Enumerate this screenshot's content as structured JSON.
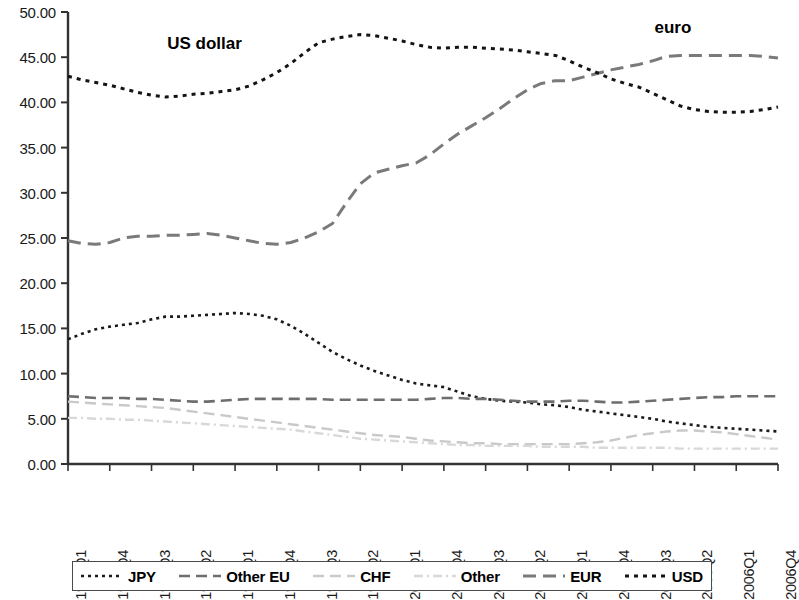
{
  "chart_data": {
    "type": "line",
    "title": "",
    "xlabel": "",
    "ylabel": "",
    "ylim": [
      0,
      50
    ],
    "ytick_step": 5,
    "grid": false,
    "legend_position": "bottom",
    "y_ticks": [
      "0.00",
      "5.00",
      "10.00",
      "15.00",
      "20.00",
      "25.00",
      "30.00",
      "35.00",
      "40.00",
      "45.00",
      "50.00"
    ],
    "x": [
      "1994Q1",
      "1994Q2",
      "1994Q3",
      "1994Q4",
      "1995Q1",
      "1995Q2",
      "1995Q3",
      "1995Q4",
      "1996Q1",
      "1996Q2",
      "1996Q3",
      "1996Q4",
      "1997Q1",
      "1997Q2",
      "1997Q3",
      "1997Q4",
      "1998Q1",
      "1998Q2",
      "1998Q3",
      "1998Q4",
      "1999Q1",
      "1999Q2",
      "1999Q3",
      "1999Q4",
      "2000Q1",
      "2000Q2",
      "2000Q3",
      "2000Q4",
      "2001Q1",
      "2001Q2",
      "2001Q3",
      "2001Q4",
      "2002Q1",
      "2002Q2",
      "2002Q3",
      "2002Q4",
      "2003Q1",
      "2003Q2",
      "2003Q3",
      "2003Q4",
      "2004Q1",
      "2004Q2",
      "2004Q3",
      "2004Q4",
      "2005Q1",
      "2005Q2",
      "2005Q3",
      "2005Q4",
      "2006Q1",
      "2006Q2",
      "2006Q3",
      "2006Q4"
    ],
    "x_tick_labels": [
      "1994Q1",
      "1994Q4",
      "1995Q3",
      "1996Q2",
      "1997Q1",
      "1997Q4",
      "1998Q3",
      "1999Q2",
      "2000Q1",
      "2000Q4",
      "2001Q3",
      "2002Q2",
      "2003Q1",
      "2003Q4",
      "2004Q3",
      "2005Q2",
      "2006Q1",
      "2006Q4"
    ],
    "x_tick_indices": [
      0,
      3,
      6,
      9,
      12,
      15,
      18,
      21,
      24,
      27,
      30,
      33,
      36,
      39,
      42,
      45,
      48,
      51
    ],
    "series": [
      {
        "name": "JPY",
        "color": "#1a1a1a",
        "dash": "3,4",
        "width": 2.6,
        "values": [
          13.8,
          14.4,
          14.9,
          15.2,
          15.4,
          15.6,
          16.0,
          16.3,
          16.3,
          16.4,
          16.5,
          16.6,
          16.7,
          16.6,
          16.4,
          16.0,
          15.3,
          14.4,
          13.4,
          12.4,
          11.6,
          10.9,
          10.3,
          9.8,
          9.3,
          8.9,
          8.7,
          8.5,
          8.0,
          7.5,
          7.2,
          7.0,
          6.9,
          6.8,
          6.6,
          6.5,
          6.3,
          6.0,
          5.8,
          5.6,
          5.4,
          5.2,
          5.0,
          4.7,
          4.5,
          4.3,
          4.1,
          4.0,
          3.9,
          3.8,
          3.7,
          3.6
        ]
      },
      {
        "name": "Other EU",
        "color": "#6e6e6e",
        "dash": "11,6",
        "width": 2.6,
        "values": [
          7.5,
          7.4,
          7.3,
          7.3,
          7.3,
          7.2,
          7.2,
          7.1,
          7.0,
          6.9,
          6.9,
          7.0,
          7.1,
          7.2,
          7.2,
          7.2,
          7.2,
          7.2,
          7.2,
          7.1,
          7.1,
          7.1,
          7.1,
          7.1,
          7.1,
          7.1,
          7.2,
          7.3,
          7.3,
          7.2,
          7.2,
          7.1,
          7.0,
          6.9,
          6.9,
          6.9,
          7.0,
          7.0,
          6.9,
          6.8,
          6.8,
          6.9,
          7.0,
          7.1,
          7.2,
          7.3,
          7.4,
          7.4,
          7.5,
          7.5,
          7.5,
          7.5
        ]
      },
      {
        "name": "CHF",
        "color": "#c9c9c9",
        "dash": "11,6",
        "width": 2.4,
        "values": [
          6.9,
          6.8,
          6.7,
          6.6,
          6.5,
          6.4,
          6.3,
          6.2,
          6.0,
          5.8,
          5.6,
          5.4,
          5.2,
          5.0,
          4.8,
          4.6,
          4.4,
          4.2,
          4.0,
          3.8,
          3.6,
          3.4,
          3.2,
          3.1,
          3.0,
          2.8,
          2.6,
          2.5,
          2.4,
          2.3,
          2.3,
          2.2,
          2.2,
          2.2,
          2.2,
          2.2,
          2.2,
          2.3,
          2.4,
          2.6,
          2.9,
          3.2,
          3.4,
          3.6,
          3.7,
          3.7,
          3.6,
          3.5,
          3.3,
          3.1,
          2.9,
          2.7
        ]
      },
      {
        "name": "Other",
        "color": "#d8d8d8",
        "dash": "9,4,2,4",
        "width": 2.4,
        "values": [
          5.1,
          5.1,
          5.0,
          5.0,
          4.9,
          4.9,
          4.8,
          4.7,
          4.6,
          4.5,
          4.4,
          4.3,
          4.2,
          4.1,
          4.0,
          3.9,
          3.8,
          3.6,
          3.4,
          3.2,
          3.0,
          2.8,
          2.7,
          2.6,
          2.5,
          2.4,
          2.3,
          2.2,
          2.1,
          2.1,
          2.0,
          2.0,
          2.0,
          2.0,
          1.9,
          1.9,
          1.9,
          1.9,
          1.8,
          1.8,
          1.8,
          1.8,
          1.8,
          1.8,
          1.7,
          1.7,
          1.7,
          1.7,
          1.7,
          1.7,
          1.7,
          1.7
        ]
      },
      {
        "name": "EUR",
        "color": "#7a7a7a",
        "dash": "13,7",
        "width": 3.0,
        "values": [
          24.7,
          24.4,
          24.3,
          24.5,
          25.0,
          25.2,
          25.2,
          25.3,
          25.3,
          25.4,
          25.5,
          25.3,
          25.0,
          24.7,
          24.4,
          24.3,
          24.5,
          25.0,
          25.7,
          26.6,
          28.9,
          31.0,
          32.2,
          32.6,
          33.0,
          33.3,
          34.2,
          35.4,
          36.5,
          37.4,
          38.3,
          39.3,
          40.4,
          41.4,
          42.1,
          42.4,
          42.4,
          42.8,
          43.2,
          43.6,
          43.9,
          44.2,
          44.6,
          45.1,
          45.2,
          45.2,
          45.2,
          45.2,
          45.2,
          45.2,
          45.1,
          44.9
        ]
      },
      {
        "name": "USD",
        "color": "#141414",
        "dash": "4,5",
        "width": 3.0,
        "values": [
          42.9,
          42.5,
          42.2,
          41.9,
          41.5,
          41.1,
          40.8,
          40.6,
          40.7,
          40.9,
          41.0,
          41.2,
          41.4,
          41.8,
          42.5,
          43.3,
          44.3,
          45.5,
          46.6,
          47.0,
          47.3,
          47.5,
          47.4,
          47.1,
          46.8,
          46.4,
          46.1,
          46.0,
          46.1,
          46.1,
          46.0,
          45.9,
          45.8,
          45.6,
          45.4,
          45.2,
          44.6,
          43.9,
          43.3,
          42.6,
          42.1,
          41.7,
          41.0,
          40.3,
          39.6,
          39.2,
          39.0,
          38.9,
          38.9,
          39.0,
          39.2,
          39.5
        ]
      }
    ],
    "annotations": [
      {
        "text": "US dollar",
        "x_index": 10,
        "value": 46.5
      },
      {
        "text": "euro",
        "x_index": 45,
        "value": 48.2
      }
    ]
  },
  "legend": {
    "items": [
      {
        "label": "JPY"
      },
      {
        "label": "Other EU"
      },
      {
        "label": "CHF"
      },
      {
        "label": "Other"
      },
      {
        "label": "EUR"
      },
      {
        "label": "USD"
      }
    ]
  }
}
